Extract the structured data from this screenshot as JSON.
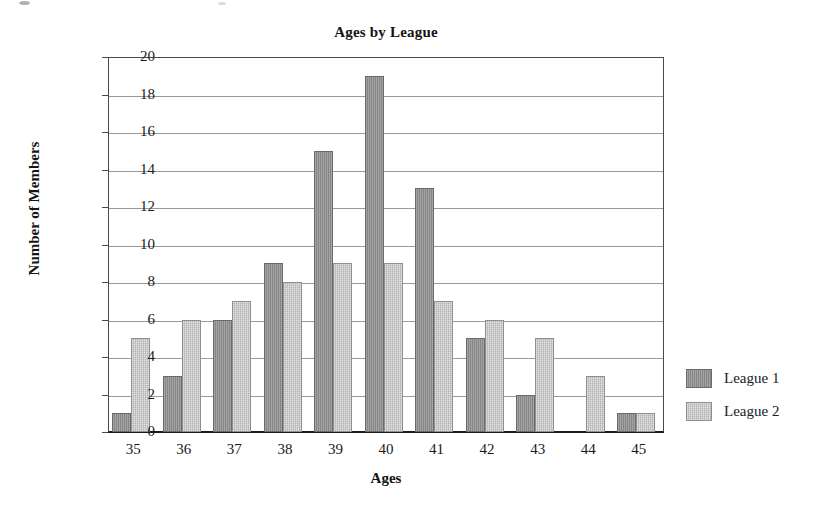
{
  "chart_data": {
    "type": "bar",
    "title": "Ages by League",
    "xlabel": "Ages",
    "ylabel": "Number of Members",
    "categories": [
      "35",
      "36",
      "37",
      "38",
      "39",
      "40",
      "41",
      "42",
      "43",
      "44",
      "45"
    ],
    "series": [
      {
        "name": "League 1",
        "color": "#8d8d8d",
        "values": [
          1,
          3,
          6,
          9,
          15,
          19,
          13,
          5,
          2,
          0,
          1
        ]
      },
      {
        "name": "League 2",
        "color": "#b3b3b3",
        "values": [
          5,
          6,
          7,
          8,
          9,
          9,
          7,
          6,
          5,
          3,
          1
        ]
      }
    ],
    "ylim": [
      0,
      20
    ],
    "yticks": [
      "0",
      "2",
      "4",
      "6",
      "8",
      "10",
      "12",
      "14",
      "16",
      "18",
      "20"
    ],
    "grid": true,
    "legend_position": "right"
  }
}
